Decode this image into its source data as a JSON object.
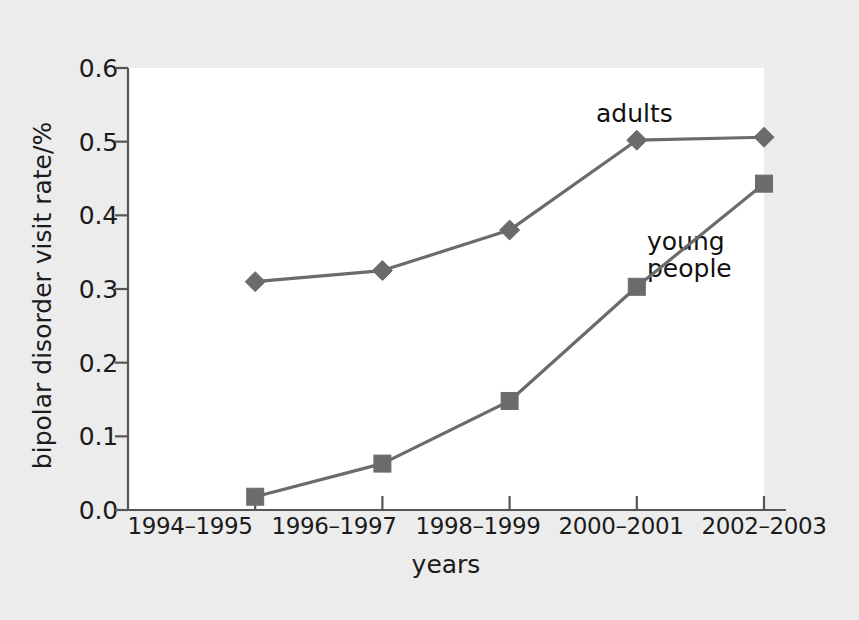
{
  "figure": {
    "background_color": "#ececec",
    "panel_color": "#ffffff",
    "series_color": "#6b6b6b",
    "axis_color": "#555555",
    "text_color": "#1b1b1b"
  },
  "annotations": {
    "adults": "adults",
    "young_people": "young\npeople"
  },
  "chart_data": {
    "type": "line",
    "title": "",
    "xlabel": "years",
    "ylabel": "bipolar disorder visit rate/%",
    "categories": [
      "1994–1995",
      "1996–1997",
      "1998–1999",
      "2000–2001",
      "2002–2003"
    ],
    "ylim": [
      0.0,
      0.6
    ],
    "ytick_labels": [
      "0.0",
      "0.1",
      "0.2",
      "0.3",
      "0.4",
      "0.5",
      "0.6"
    ],
    "ytick_values": [
      0.0,
      0.1,
      0.2,
      0.3,
      0.4,
      0.5,
      0.6
    ],
    "grid": false,
    "legend": "inline-annotations",
    "series": [
      {
        "name": "adults",
        "marker": "diamond",
        "color": "#6b6b6b",
        "values": [
          0.31,
          0.325,
          0.38,
          0.502,
          0.506
        ]
      },
      {
        "name": "young people",
        "marker": "square",
        "color": "#6b6b6b",
        "values": [
          0.018,
          0.063,
          0.148,
          0.303,
          0.443
        ]
      }
    ]
  }
}
